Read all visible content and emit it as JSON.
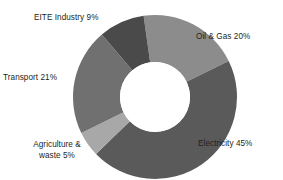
{
  "chart_data": {
    "type": "pie",
    "variant": "donut",
    "title": "",
    "subtitle": "",
    "xlabel": "",
    "ylabel": "",
    "grid": false,
    "legend_position": "none",
    "label_format": "{name} {value}%",
    "units": "percent",
    "total": 100,
    "categories": [
      "Oil & Gas",
      "Electricity",
      "Agriculture & waste",
      "Transport",
      "EITE Industry"
    ],
    "values": [
      20,
      45,
      5,
      21,
      9
    ],
    "colors": [
      "#8c8c8c",
      "#5a5a5a",
      "#a8a8a8",
      "#707070",
      "#4a4a4a"
    ],
    "slices": [
      {
        "name": "Oil & Gas",
        "value": 20,
        "color": "#8c8c8c",
        "label": "Oil & Gas 20%",
        "label_position": "outside-right-top"
      },
      {
        "name": "Electricity",
        "value": 45,
        "color": "#5a5a5a",
        "label": "Electricity 45%",
        "label_position": "outside-right-bottom"
      },
      {
        "name": "Agriculture & waste",
        "value": 5,
        "color": "#a8a8a8",
        "label": "Agriculture &\nwaste 5%",
        "label_position": "outside-left-bottom"
      },
      {
        "name": "Transport",
        "value": 21,
        "color": "#707070",
        "label": "Transport 21%",
        "label_position": "outside-left-middle"
      },
      {
        "name": "EITE Industry",
        "value": 9,
        "color": "#4a4a4a",
        "label": "EITE Industry 9%",
        "label_position": "outside-left-top"
      }
    ],
    "geometry": {
      "center_x": 155,
      "center_y": 97,
      "outer_radius": 82,
      "inner_radius": 35,
      "start_angle_deg": -8,
      "direction": "clockwise",
      "hole_color": "#ffffff"
    }
  }
}
